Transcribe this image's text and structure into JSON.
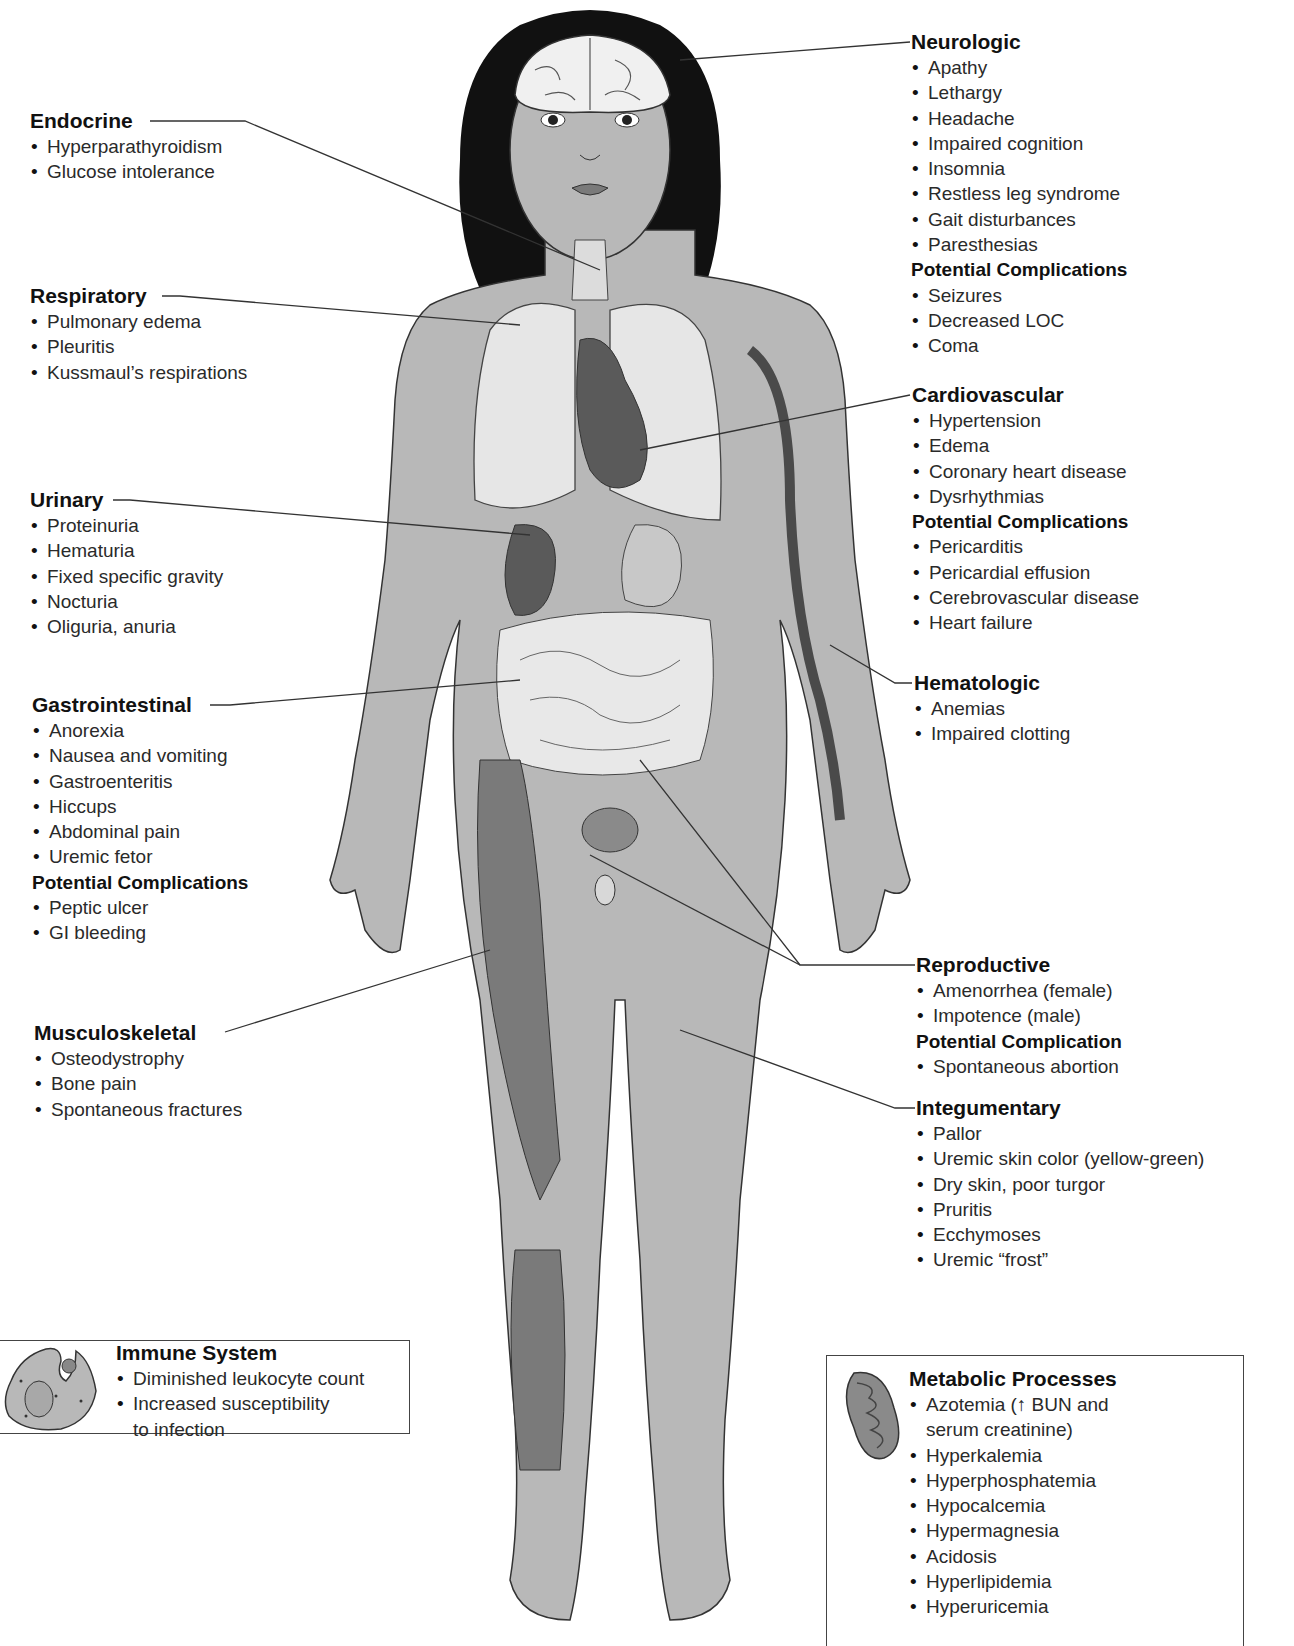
{
  "diagram": {
    "colors": {
      "skin": "#b8b8b8",
      "hair": "#111111",
      "organs_dark": "#5a5a5a",
      "organs_light": "#e6e6e6",
      "leader_line": "#333333"
    }
  },
  "labels": {
    "endocrine": {
      "title": "Endocrine",
      "items": [
        "Hyperparathyroidism",
        "Glucose intolerance"
      ]
    },
    "respiratory": {
      "title": "Respiratory",
      "items": [
        "Pulmonary edema",
        "Pleuritis",
        "Kussmaul’s respirations"
      ]
    },
    "urinary": {
      "title": "Urinary",
      "items": [
        "Proteinuria",
        "Hematuria",
        "Fixed specific gravity",
        "Nocturia",
        "Oliguria, anuria"
      ]
    },
    "gastrointestinal": {
      "title": "Gastrointestinal",
      "items": [
        "Anorexia",
        "Nausea and vomiting",
        "Gastroenteritis",
        "Hiccups",
        "Abdominal pain",
        "Uremic fetor"
      ],
      "complications_title": "Potential Complications",
      "complications": [
        "Peptic ulcer",
        "GI bleeding"
      ]
    },
    "musculoskeletal": {
      "title": "Musculoskeletal",
      "items": [
        "Osteodystrophy",
        "Bone pain",
        "Spontaneous fractures"
      ]
    },
    "neurologic": {
      "title": "Neurologic",
      "items": [
        "Apathy",
        "Lethargy",
        "Headache",
        "Impaired cognition",
        "Insomnia",
        "Restless leg syndrome",
        "Gait disturbances",
        "Paresthesias"
      ],
      "complications_title": "Potential Complications",
      "complications": [
        "Seizures",
        "Decreased LOC",
        "Coma"
      ]
    },
    "cardiovascular": {
      "title": "Cardiovascular",
      "items": [
        "Hypertension",
        "Edema",
        "Coronary heart disease",
        "Dysrhythmias"
      ],
      "complications_title": "Potential Complications",
      "complications": [
        "Pericarditis",
        "Pericardial effusion",
        "Cerebrovascular disease",
        "Heart failure"
      ]
    },
    "hematologic": {
      "title": "Hematologic",
      "items": [
        "Anemias",
        "Impaired clotting"
      ]
    },
    "reproductive": {
      "title": "Reproductive",
      "items": [
        "Amenorrhea (female)",
        "Impotence (male)"
      ],
      "complications_title": "Potential Complication",
      "complications": [
        "Spontaneous abortion"
      ]
    },
    "integumentary": {
      "title": "Integumentary",
      "items": [
        "Pallor",
        "Uremic skin color (yellow-green)",
        "Dry skin, poor turgor",
        "Pruritis",
        "Ecchymoses",
        "Uremic “frost”"
      ]
    }
  },
  "boxes": {
    "immune": {
      "title": "Immune System",
      "icon": "leukocyte-icon",
      "items": [
        "Diminished leukocyte count",
        "Increased susceptibility"
      ],
      "item2_cont": "to infection"
    },
    "metabolic": {
      "title": "Metabolic Processes",
      "icon": "mitochondrion-icon",
      "item1": "Azotemia (↑ BUN and",
      "item1_cont": "serum creatinine)",
      "items": [
        "Hyperkalemia",
        "Hyperphosphatemia",
        "Hypocalcemia",
        "Hypermagnesia",
        "Acidosis",
        "Hyperlipidemia",
        "Hyperuricemia"
      ]
    }
  }
}
